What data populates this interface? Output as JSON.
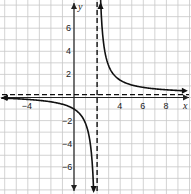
{
  "chart_data": {
    "type": "line",
    "title": "",
    "xlabel": "x",
    "ylabel": "y",
    "xlim": [
      -6.4,
      10
    ],
    "ylim": [
      -8.3,
      8.4
    ],
    "grid": true,
    "grid_step": 1,
    "x_tick_labels": [
      "-4",
      "4",
      "6",
      "8"
    ],
    "y_tick_labels": [
      "6",
      "4",
      "2",
      "-2",
      "-4",
      "-6"
    ],
    "asymptotes": {
      "vertical_x": 2,
      "horizontal_y": 0.25
    },
    "series": [
      {
        "name": "rational function",
        "formula": "y = 2.5/(x-2) + 0.25",
        "points_left": [
          [
            -6.4,
            -0.05
          ],
          [
            -4,
            -0.17
          ],
          [
            -2,
            -0.38
          ],
          [
            0,
            -1.0
          ],
          [
            1,
            -2.25
          ],
          [
            1.5,
            -4.75
          ],
          [
            1.7,
            -8.1
          ]
        ],
        "points_right": [
          [
            2.3,
            8.6
          ],
          [
            2.5,
            5.25
          ],
          [
            3,
            2.75
          ],
          [
            4,
            1.5
          ],
          [
            6,
            0.875
          ],
          [
            8,
            0.67
          ],
          [
            9.6,
            0.58
          ]
        ]
      }
    ],
    "colors": {
      "curve": "#111111",
      "grid": "#c8c8c8",
      "axis": "#222222"
    }
  }
}
